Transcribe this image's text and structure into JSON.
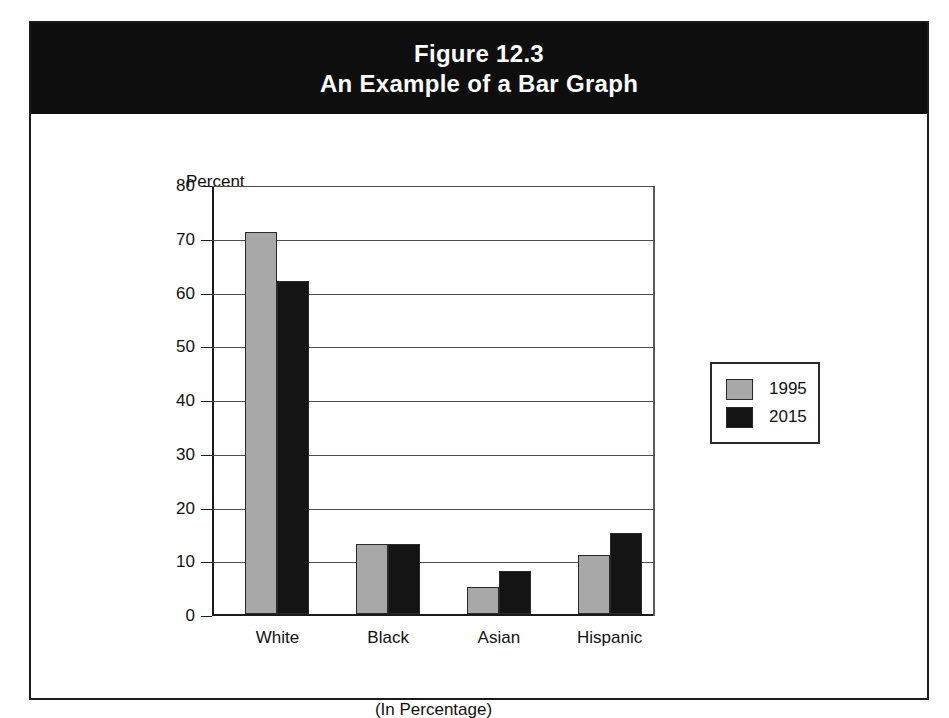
{
  "figure": {
    "title_line_1": "Figure 12.3",
    "title_line_2": "An Example of a Bar Graph",
    "band_color": "#0e0e0e",
    "frame_color": "#1b1b1b"
  },
  "chart_data": {
    "type": "bar",
    "title": "An Example of a Bar Graph",
    "categories": [
      "White",
      "Black",
      "Asian",
      "Hispanic"
    ],
    "series": [
      {
        "name": "1995",
        "values": [
          71,
          13,
          5,
          11
        ],
        "color": "#a8a8a8"
      },
      {
        "name": "2015",
        "values": [
          62,
          13,
          8,
          15
        ],
        "color": "#141414"
      }
    ],
    "ylabel": "Percent",
    "xlabel": "(In Percentage)",
    "ylim": [
      0,
      80
    ],
    "ytick_labels": [
      "0",
      "10",
      "20",
      "30",
      "40",
      "50",
      "60",
      "70",
      "80"
    ],
    "ytick_values": [
      0,
      10,
      20,
      30,
      40,
      50,
      60,
      70,
      80
    ],
    "grid": true,
    "legend_position": "right"
  }
}
